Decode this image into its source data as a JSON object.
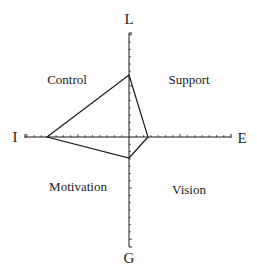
{
  "diagram": {
    "type": "quadrant-radar",
    "origin": {
      "x": 129,
      "y": 137
    },
    "axes": {
      "top": {
        "label": "L",
        "end": {
          "x": 129,
          "y": 33
        }
      },
      "right": {
        "label": "E",
        "end": {
          "x": 231,
          "y": 137
        }
      },
      "bottom": {
        "label": "G",
        "end": {
          "x": 129,
          "y": 247
        }
      },
      "left": {
        "label": "I",
        "end": {
          "x": 25,
          "y": 137
        }
      }
    },
    "tick_spacing": 7.3,
    "major_tick_every": 7,
    "quadrants": {
      "top_left": "Control",
      "top_right": "Support",
      "bottom_left": "Motivation",
      "bottom_right": "Vision"
    },
    "profile_polygon": [
      {
        "axis": "L",
        "x": 129,
        "y": 75
      },
      {
        "axis": "E",
        "x": 148,
        "y": 137
      },
      {
        "axis": "G",
        "x": 129,
        "y": 158
      },
      {
        "axis": "I",
        "x": 47,
        "y": 137
      }
    ],
    "line_color": "#1a1a1a"
  }
}
